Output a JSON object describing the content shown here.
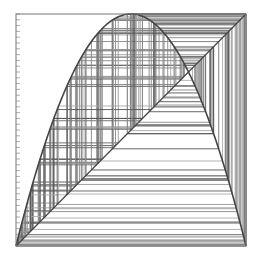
{
  "chart_data": {
    "type": "line",
    "title": "",
    "subtitle": "",
    "xlabel": "",
    "ylabel": "",
    "map": "logistic",
    "r": 4.0,
    "x0": 0.1234,
    "iterations": 180,
    "xlim": [
      0,
      1
    ],
    "ylim": [
      0,
      1
    ],
    "grid": false,
    "legend": null,
    "series": [
      {
        "name": "f(x) = 4x(1-x)",
        "kind": "curve",
        "color": "#444444"
      },
      {
        "name": "y = x",
        "kind": "line",
        "color": "#444444"
      },
      {
        "name": "cobweb iterates",
        "kind": "segments",
        "color": "#555555"
      }
    ],
    "left_axis_minor_ticks": 40
  },
  "frame": {
    "left": 16,
    "top": 14,
    "right": 246,
    "bottom": 246,
    "border_color": "#777777"
  }
}
